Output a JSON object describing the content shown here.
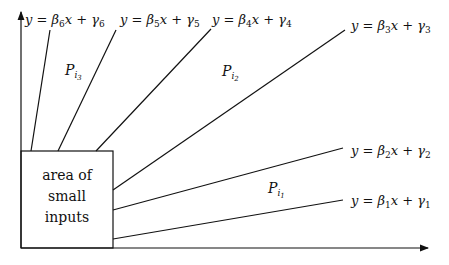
{
  "diagram": {
    "box": {
      "lines": [
        "area of",
        "small",
        "inputs"
      ]
    },
    "lines": [
      {
        "id": "l1",
        "label_pre": "y = β",
        "sub1": "1",
        "label_mid": "x + γ",
        "sub2": "1"
      },
      {
        "id": "l2",
        "label_pre": "y = β",
        "sub1": "2",
        "label_mid": "x + γ",
        "sub2": "2"
      },
      {
        "id": "l3",
        "label_pre": "y = β",
        "sub1": "3",
        "label_mid": "x + γ",
        "sub2": "3"
      },
      {
        "id": "l4",
        "label_pre": "y = β",
        "sub1": "4",
        "label_mid": "x + γ",
        "sub2": "4"
      },
      {
        "id": "l5",
        "label_pre": "y = β",
        "sub1": "5",
        "label_mid": "x + γ",
        "sub2": "5"
      },
      {
        "id": "l6",
        "label_pre": "y = β",
        "sub1": "6",
        "label_mid": "x + γ",
        "sub2": "6"
      }
    ],
    "regions": [
      {
        "id": "r1",
        "base": "P",
        "sub": "i",
        "subsub": "1"
      },
      {
        "id": "r2",
        "base": "P",
        "sub": "i",
        "subsub": "2"
      },
      {
        "id": "r3",
        "base": "P",
        "sub": "i",
        "subsub": "3"
      }
    ]
  }
}
